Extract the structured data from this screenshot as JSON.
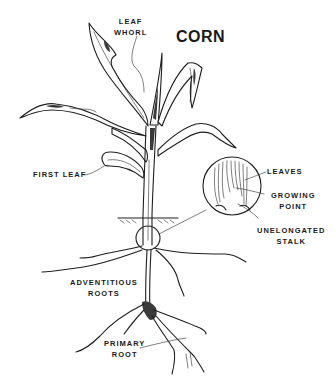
{
  "diagram": {
    "title": "CORN",
    "labels": {
      "leaf_whorl": [
        "LEAF",
        "WHORL"
      ],
      "first_leaf": "FIRST LEAF",
      "leaves": "LEAVES",
      "growing_point": [
        "GROWING",
        "POINT"
      ],
      "unelongated_stalk": [
        "UNELONGATED",
        "STALK"
      ],
      "adventitious_roots": [
        "ADVENTITIOUS",
        "ROOTS"
      ],
      "primary_root": [
        "PRIMARY",
        "ROOT"
      ]
    },
    "colors": {
      "background": "#ffffff",
      "ink": "#1e1e1e"
    }
  }
}
